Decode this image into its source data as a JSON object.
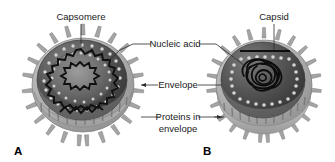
{
  "figure": {
    "background_color": "#ffffff"
  },
  "labels": {
    "capsomere": "Capsomere",
    "nucleic_acid": "Nucleic acid",
    "envelope": "Envelope",
    "proteins_in_envelope_line1": "Proteins in",
    "proteins_in_envelope_line2": "envelope",
    "capsid": "Capsid"
  },
  "panels": [
    {
      "letter": "A",
      "name": "enveloped-helical-virus",
      "description": "Cut-away enveloped virus with helical nucleic acid and capsomeres",
      "labels": [
        "Capsomere",
        "Nucleic acid",
        "Envelope",
        "Proteins in envelope"
      ]
    },
    {
      "letter": "B",
      "name": "enveloped-icosahedral-virus",
      "description": "Cut-away enveloped virus with icosahedral capsid and coiled nucleic acid",
      "labels": [
        "Capsid",
        "Nucleic acid",
        "Envelope",
        "Proteins in envelope"
      ]
    }
  ],
  "colors": {
    "background": "#ffffff",
    "text": "#1a1a1a",
    "leader_line": "#2b2b2b",
    "envelope_rim_light": "#b9b9b9",
    "envelope_rim_mid": "#9d9d9d",
    "spike": "#a8a8a8",
    "interior_dark": "#4a4a4a",
    "interior_darker": "#3a3a3a",
    "interior_mid": "#6a6a6a",
    "capsomere_bead": "#d2d2d2",
    "nucleic_acid_strand": "#111111"
  }
}
